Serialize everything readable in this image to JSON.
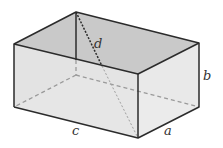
{
  "diagram": {
    "type": "rectangular-box",
    "labels": {
      "a": "a",
      "b": "b",
      "c": "c",
      "d": "d"
    },
    "colors": {
      "edge": "#2b2b2b",
      "hidden_edge": "#9a9a9a",
      "top_face": "#c9c9c9",
      "front_face": "#e4e4e4",
      "side_face": "#e8e8e8",
      "background": "#ffffff"
    }
  }
}
